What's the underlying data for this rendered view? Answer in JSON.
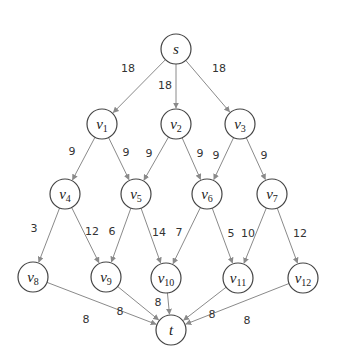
{
  "diagram": {
    "type": "flow-network",
    "nodes": [
      {
        "id": "s",
        "label": "s",
        "sub": "",
        "x": 176,
        "y": 49
      },
      {
        "id": "v1",
        "label": "v",
        "sub": "1",
        "x": 102,
        "y": 124
      },
      {
        "id": "v2",
        "label": "v",
        "sub": "2",
        "x": 176,
        "y": 124
      },
      {
        "id": "v3",
        "label": "v",
        "sub": "3",
        "x": 240,
        "y": 124
      },
      {
        "id": "v4",
        "label": "v",
        "sub": "4",
        "x": 65,
        "y": 194
      },
      {
        "id": "v5",
        "label": "v",
        "sub": "5",
        "x": 136,
        "y": 194
      },
      {
        "id": "v6",
        "label": "v",
        "sub": "6",
        "x": 207,
        "y": 194
      },
      {
        "id": "v7",
        "label": "v",
        "sub": "7",
        "x": 272,
        "y": 194
      },
      {
        "id": "v8",
        "label": "v",
        "sub": "8",
        "x": 33,
        "y": 277
      },
      {
        "id": "v9",
        "label": "v",
        "sub": "9",
        "x": 106,
        "y": 277
      },
      {
        "id": "v10",
        "label": "v",
        "sub": "10",
        "x": 166,
        "y": 278
      },
      {
        "id": "v11",
        "label": "v",
        "sub": "11",
        "x": 238,
        "y": 278
      },
      {
        "id": "v12",
        "label": "v",
        "sub": "12",
        "x": 303,
        "y": 278
      },
      {
        "id": "t",
        "label": "t",
        "sub": "",
        "x": 171,
        "y": 330
      }
    ],
    "edges": [
      {
        "from": "s",
        "to": "v1",
        "weight": "18",
        "lx": 128,
        "ly": 72
      },
      {
        "from": "s",
        "to": "v2",
        "weight": "18",
        "lx": 165,
        "ly": 89
      },
      {
        "from": "s",
        "to": "v3",
        "weight": "18",
        "lx": 219,
        "ly": 72
      },
      {
        "from": "v1",
        "to": "v4",
        "weight": "9",
        "lx": 72,
        "ly": 155
      },
      {
        "from": "v1",
        "to": "v5",
        "weight": "9",
        "lx": 126,
        "ly": 156
      },
      {
        "from": "v2",
        "to": "v5",
        "weight": "9",
        "lx": 149,
        "ly": 157
      },
      {
        "from": "v2",
        "to": "v6",
        "weight": "9",
        "lx": 200,
        "ly": 157
      },
      {
        "from": "v3",
        "to": "v6",
        "weight": "9",
        "lx": 216,
        "ly": 159
      },
      {
        "from": "v3",
        "to": "v7",
        "weight": "9",
        "lx": 264,
        "ly": 159
      },
      {
        "from": "v4",
        "to": "v8",
        "weight": "3",
        "lx": 34,
        "ly": 232
      },
      {
        "from": "v4",
        "to": "v9",
        "weight": "12",
        "lx": 92,
        "ly": 235
      },
      {
        "from": "v5",
        "to": "v9",
        "weight": "6",
        "lx": 112,
        "ly": 235
      },
      {
        "from": "v5",
        "to": "v10",
        "weight": "14",
        "lx": 159,
        "ly": 236
      },
      {
        "from": "v6",
        "to": "v10",
        "weight": "7",
        "lx": 179,
        "ly": 236
      },
      {
        "from": "v6",
        "to": "v11",
        "weight": "5",
        "lx": 231,
        "ly": 237
      },
      {
        "from": "v7",
        "to": "v11",
        "weight": "10",
        "lx": 248,
        "ly": 237
      },
      {
        "from": "v7",
        "to": "v12",
        "weight": "12",
        "lx": 300,
        "ly": 237
      },
      {
        "from": "v8",
        "to": "t",
        "weight": "8",
        "lx": 86,
        "ly": 323
      },
      {
        "from": "v9",
        "to": "t",
        "weight": "8",
        "lx": 120,
        "ly": 315
      },
      {
        "from": "v10",
        "to": "t",
        "weight": "8",
        "lx": 158,
        "ly": 306
      },
      {
        "from": "v11",
        "to": "t",
        "weight": "8",
        "lx": 212,
        "ly": 318
      },
      {
        "from": "v12",
        "to": "t",
        "weight": "8",
        "lx": 247,
        "ly": 324
      }
    ]
  },
  "colors": {
    "node_stroke": "#444444",
    "edge": "#8a8a8a",
    "text": "#222222"
  }
}
